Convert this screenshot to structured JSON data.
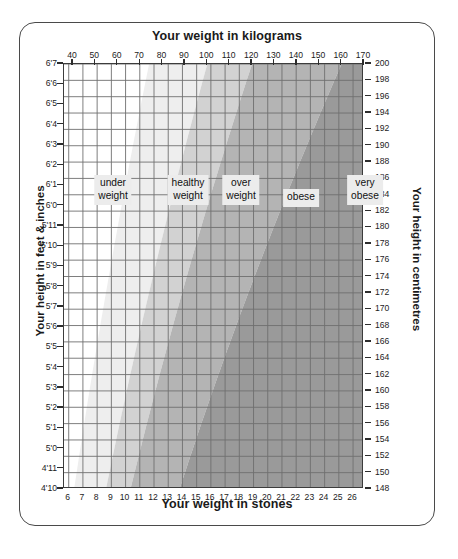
{
  "chart_data": {
    "type": "heatmap",
    "top_axis": {
      "label": "Your weight in kilograms",
      "unit": "kg",
      "ticks": [
        40,
        50,
        60,
        70,
        80,
        90,
        100,
        110,
        120,
        130,
        140,
        150,
        160,
        170
      ],
      "range": [
        36,
        170
      ]
    },
    "bottom_axis": {
      "label": "Your weight in stones",
      "unit": "st",
      "ticks": [
        6,
        7,
        8,
        9,
        10,
        11,
        12,
        13,
        14,
        15,
        16,
        17,
        18,
        19,
        20,
        21,
        22,
        23,
        24,
        25,
        26
      ],
      "range": [
        5.67,
        26.77
      ]
    },
    "left_axis": {
      "label": "Your height in feet & inches",
      "unit": "ft-in",
      "ticks": [
        "6'7",
        "6'6",
        "6'5",
        "6'4",
        "6'3",
        "6'2",
        "6'1",
        "6'0",
        "5'11",
        "5'10",
        "5'9",
        "5'8",
        "5'7",
        "5'6",
        "5'5",
        "5'4",
        "5'3",
        "5'2",
        "5'1",
        "5'0",
        "4'11",
        "4'10"
      ],
      "range_top": "6'7",
      "range_bottom": "4'10"
    },
    "right_axis": {
      "label": "Your height in centimetres",
      "unit": "cm",
      "ticks": [
        200,
        198,
        196,
        194,
        192,
        190,
        188,
        186,
        184,
        182,
        180,
        178,
        176,
        174,
        172,
        170,
        168,
        166,
        164,
        162,
        160,
        158,
        156,
        154,
        152,
        150,
        148
      ],
      "range": [
        148,
        200
      ]
    },
    "bands": [
      {
        "name": "under weight",
        "label": "under\nweight",
        "color": "#ffffff",
        "bmi_max": 18.5
      },
      {
        "name": "healthy weight",
        "label": "healthy\nweight",
        "color": "#eeeeee",
        "bmi_min": 18.5,
        "bmi_max": 25
      },
      {
        "name": "over weight",
        "label": "over\nweight",
        "color": "#d2d2d2",
        "bmi_min": 25,
        "bmi_max": 30
      },
      {
        "name": "obese",
        "label": "obese",
        "color": "#b4b4b4",
        "bmi_min": 30,
        "bmi_max": 40
      },
      {
        "name": "very obese",
        "label": "very\nobese",
        "color": "#9a9a9a",
        "bmi_min": 40
      }
    ],
    "grid": true,
    "legend_position": "inline-bands"
  },
  "colors": {
    "under_weight": "#ffffff",
    "healthy_weight": "#eeeeee",
    "over_weight": "#d2d2d2",
    "obese": "#b4b4b4",
    "very_obese": "#9a9a9a",
    "grid_line": "#6f6f6f",
    "frame": "#4a4a4a",
    "label_bg": "#ececec"
  }
}
